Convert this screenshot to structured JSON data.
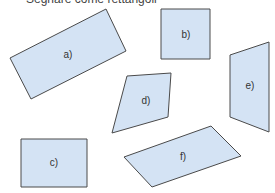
{
  "title": "Segnare come rettangoli",
  "colors": {
    "fill": "#d4e3f4",
    "stroke": "#4a4a4a"
  },
  "shapes": [
    {
      "id": "a",
      "label": "a)",
      "points": "106,9 126,51 31,99 10,58",
      "label_pos": [
        68,
        55
      ]
    },
    {
      "id": "b",
      "label": "b)",
      "points": "161,9 210,9 210,59 161,59",
      "label_pos": [
        186,
        35
      ]
    },
    {
      "id": "c",
      "label": "c)",
      "points": "21,139 87,139 87,187 21,187",
      "label_pos": [
        54,
        163
      ]
    },
    {
      "id": "d",
      "label": "d)",
      "points": "127,76 171,73 168,117 112,133",
      "label_pos": [
        146,
        101
      ]
    },
    {
      "id": "e",
      "label": "e)",
      "points": "230,55 269,42 269,132 230,117",
      "label_pos": [
        250,
        86
      ]
    },
    {
      "id": "f",
      "label": "f)",
      "points": "124,157 211,126 241,156 152,187",
      "label_pos": [
        183,
        157
      ]
    }
  ]
}
